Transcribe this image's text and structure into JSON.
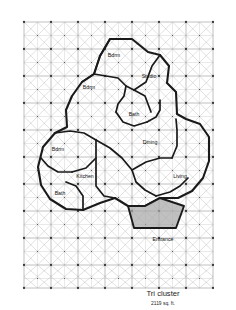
{
  "figure": {
    "title": "Tri cluster",
    "area": "2119 sq. ft."
  },
  "colors": {
    "paper": "#ffffff",
    "grid_major": "#8e8e8e",
    "grid_minor": "#b3b3b3",
    "grid_diagonal": "#9a9a9a",
    "node": "#3a3a3a",
    "wall": "#1a1a1a",
    "entrance_fill": "#a8a8a8",
    "label_text": "#111111"
  },
  "grid": {
    "left": 24,
    "top": 22,
    "right": 213,
    "bottom": 288,
    "cell": 27,
    "cols": 7,
    "rows": 10,
    "pattern": "square grid with full diagonals and half-cell star subdivisions"
  },
  "rooms": [
    {
      "name": "bdrm-top",
      "label": "Bdrm",
      "x": 114,
      "y": 56
    },
    {
      "name": "studio",
      "label": "Studio",
      "x": 149,
      "y": 77
    },
    {
      "name": "bdrm-upper-left",
      "label": "Bdrm",
      "x": 89,
      "y": 88
    },
    {
      "name": "bath-center",
      "label": "Bath",
      "x": 134,
      "y": 115
    },
    {
      "name": "dining",
      "label": "Dining",
      "x": 150,
      "y": 143
    },
    {
      "name": "bdrm-left",
      "label": "Bdrm",
      "x": 58,
      "y": 150
    },
    {
      "name": "kitchen",
      "label": "Kitchen",
      "x": 85,
      "y": 177
    },
    {
      "name": "living",
      "label": "Living",
      "x": 180,
      "y": 177
    },
    {
      "name": "bath-left",
      "label": "Bath",
      "x": 60,
      "y": 194
    },
    {
      "name": "entrance",
      "label": "Entrance",
      "x": 163,
      "y": 240
    }
  ],
  "outline": {
    "name": "tri-cluster-envelope",
    "points": "110,39 132,39 148,52 160,55 169,66 167,83 176,92 177,114 186,119 200,124 209,137 209,161 203,178 192,191 178,198 160,198 145,206 128,206 115,198 100,203 83,210 66,209 50,199 41,185 38,167 43,147 55,133 67,127 66,110 72,96 82,82 94,74 100,56"
  },
  "interior_walls": [
    "110,39 100,56 94,74 82,82",
    "94,74 118,78 126,86 134,90",
    "134,90 146,82 152,66 160,55",
    "134,90 145,96 148,104 151,112",
    "126,86 124,96 118,104 116,112",
    "116,112 123,122 134,126 147,122",
    "147,122 156,117 160,110 160,100",
    "55,133 70,131 84,133 96,140",
    "96,140 96,158 86,168 72,172",
    "72,172 58,172 48,166 41,158",
    "96,140 110,148 122,158 132,170",
    "132,170 146,162 160,158 172,158",
    "172,158 177,146 177,130 176,119",
    "132,170 136,182 145,190 156,196",
    "156,196 170,192 180,186 188,178",
    "96,158 96,186 104,196 115,198",
    "83,210 83,196 76,186 66,182"
  ],
  "entrance_shape": {
    "name": "entrance-trapezoid",
    "points": "145,206 128,206 134,228 176,228 184,206 160,198"
  }
}
